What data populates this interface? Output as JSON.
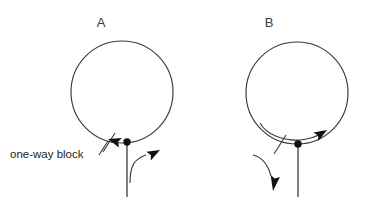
{
  "figure": {
    "background_color": "#ffffff",
    "stroke_color": "#3a3a3a",
    "fill_color": "#111111",
    "panels": [
      {
        "id": "A",
        "letter": "A",
        "circle": {
          "cx": 122,
          "cy": 92,
          "r": 51
        },
        "junction_dot": {
          "cx": 127,
          "cy": 142,
          "r": 3.6
        },
        "stem": {
          "x": 127,
          "y1": 142,
          "y2": 196
        },
        "block_marker": {
          "name": "one-way-block-tick",
          "x1": 103,
          "y1": 151,
          "x2": 114,
          "y2": 134
        },
        "arrows": [
          {
            "name": "retrograde-arrow-left",
            "direction": "left",
            "x": 106,
            "y": 139,
            "rotation": 196
          },
          {
            "name": "antegrade-branch-arrow-right",
            "direction": "right",
            "x": 159,
            "y": 151,
            "rotation": -28
          }
        ],
        "branch_curve": "from stem rising and curving right into arrowhead"
      },
      {
        "id": "B",
        "letter": "B",
        "circle": {
          "cx": 297,
          "cy": 93,
          "r": 51
        },
        "junction_dot": {
          "cx": 298,
          "cy": 144,
          "r": 3.6
        },
        "stem": {
          "x": 298,
          "y1": 144,
          "y2": 196
        },
        "block_marker": {
          "name": "one-way-block-tick",
          "x1": 274,
          "y1": 153,
          "x2": 285,
          "y2": 136
        },
        "arrows": [
          {
            "name": "reentry-arrow-right",
            "direction": "right",
            "x": 322,
            "y": 136,
            "rotation": -18
          },
          {
            "name": "exit-arrow-down",
            "direction": "down",
            "x": 269,
            "y": 186,
            "rotation": 100
          }
        ],
        "inner_arc": "inner re-entry arc running along bottom of circle ending in right arrowhead",
        "exit_curve": "curve leaving stem to the left and descending into downward arrowhead"
      }
    ],
    "labels": {
      "panel_a_letter": "A",
      "panel_b_letter": "B",
      "one_way_block": "one-way block"
    }
  }
}
